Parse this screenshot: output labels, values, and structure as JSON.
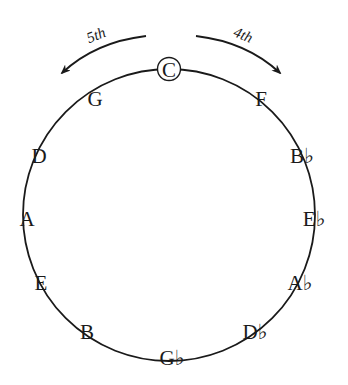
{
  "diagram": {
    "stroke_color": "#1a1a1a",
    "background": "#ffffff",
    "circle": {
      "cx": 169,
      "cy": 215,
      "r": 146
    },
    "arrows": {
      "left": {
        "label": "5th",
        "direction": "counterclockwise"
      },
      "right": {
        "label": "4th",
        "direction": "clockwise"
      }
    },
    "highlighted_note": "C",
    "notes": [
      {
        "name": "C",
        "x": 169,
        "y": 77
      },
      {
        "name": "F",
        "x": 261,
        "y": 106
      },
      {
        "name": "B♭",
        "x": 302,
        "y": 163
      },
      {
        "name": "E♭",
        "x": 314,
        "y": 226
      },
      {
        "name": "A♭",
        "x": 300,
        "y": 290
      },
      {
        "name": "D♭",
        "x": 255,
        "y": 339
      },
      {
        "name": "G♭",
        "x": 172,
        "y": 365
      },
      {
        "name": "B",
        "x": 87,
        "y": 339
      },
      {
        "name": "E",
        "x": 41,
        "y": 290
      },
      {
        "name": "A",
        "x": 27,
        "y": 226
      },
      {
        "name": "D",
        "x": 39,
        "y": 163
      },
      {
        "name": "G",
        "x": 95,
        "y": 106
      }
    ]
  }
}
